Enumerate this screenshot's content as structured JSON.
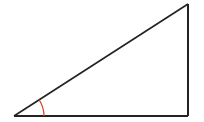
{
  "diagram": {
    "type": "right-triangle",
    "vertices": {
      "A": [
        14,
        116
      ],
      "B": [
        188,
        4
      ],
      "C": [
        188,
        116
      ]
    },
    "angle_marker": {
      "at": "A",
      "radius": 30,
      "color": "#d9402b"
    },
    "stroke_color": "#222222",
    "background": "#ffffff"
  }
}
